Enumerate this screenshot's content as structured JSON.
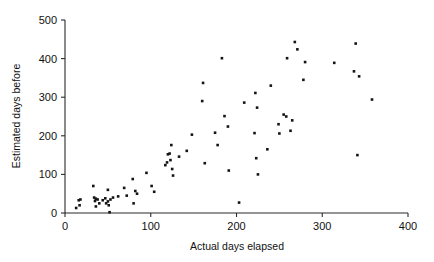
{
  "chart_data": {
    "type": "scatter",
    "title": "",
    "xlabel": "Actual days elapsed",
    "ylabel": "Estimated days before",
    "xlim": [
      0,
      400
    ],
    "ylim": [
      0,
      500
    ],
    "xticks": [
      0,
      100,
      200,
      300,
      400
    ],
    "yticks": [
      0,
      100,
      200,
      300,
      400,
      500
    ],
    "grid": false,
    "legend": null,
    "marker": "filled-square",
    "marker_color": "#141414",
    "series": [
      {
        "name": "observations",
        "points": [
          [
            13,
            13
          ],
          [
            16,
            33
          ],
          [
            17,
            20
          ],
          [
            18,
            35
          ],
          [
            33,
            70
          ],
          [
            34,
            40
          ],
          [
            35,
            31
          ],
          [
            36,
            37
          ],
          [
            36,
            17
          ],
          [
            38,
            35
          ],
          [
            40,
            25
          ],
          [
            44,
            33
          ],
          [
            47,
            38
          ],
          [
            48,
            25
          ],
          [
            50,
            60
          ],
          [
            50,
            30
          ],
          [
            51,
            20
          ],
          [
            52,
            2
          ],
          [
            53,
            35
          ],
          [
            56,
            40
          ],
          [
            62,
            43
          ],
          [
            69,
            65
          ],
          [
            72,
            45
          ],
          [
            79,
            88
          ],
          [
            80,
            25
          ],
          [
            82,
            57
          ],
          [
            84,
            50
          ],
          [
            95,
            104
          ],
          [
            101,
            70
          ],
          [
            104,
            55
          ],
          [
            117,
            124
          ],
          [
            119,
            131
          ],
          [
            120,
            152
          ],
          [
            122,
            154
          ],
          [
            123,
            137
          ],
          [
            124,
            176
          ],
          [
            125,
            114
          ],
          [
            126,
            97
          ],
          [
            133,
            146
          ],
          [
            142,
            161
          ],
          [
            148,
            203
          ],
          [
            160,
            290
          ],
          [
            161,
            337
          ],
          [
            163,
            129
          ],
          [
            175,
            208
          ],
          [
            178,
            176
          ],
          [
            183,
            401
          ],
          [
            186,
            251
          ],
          [
            190,
            224
          ],
          [
            191,
            110
          ],
          [
            203,
            27
          ],
          [
            209,
            286
          ],
          [
            221,
            207
          ],
          [
            222,
            311
          ],
          [
            223,
            142
          ],
          [
            224,
            273
          ],
          [
            225,
            100
          ],
          [
            236,
            165
          ],
          [
            240,
            330
          ],
          [
            249,
            230
          ],
          [
            250,
            206
          ],
          [
            255,
            255
          ],
          [
            258,
            250
          ],
          [
            259,
            401
          ],
          [
            263,
            213
          ],
          [
            265,
            240
          ],
          [
            268,
            443
          ],
          [
            271,
            424
          ],
          [
            278,
            345
          ],
          [
            280,
            391
          ],
          [
            314,
            389
          ],
          [
            337,
            367
          ],
          [
            339,
            439
          ],
          [
            341,
            150
          ],
          [
            343,
            354
          ],
          [
            358,
            294
          ]
        ]
      }
    ]
  },
  "axes": {
    "y_tick_labels": [
      "0",
      "100",
      "200",
      "300",
      "400",
      "500"
    ],
    "x_tick_labels": [
      "0",
      "100",
      "200",
      "300",
      "400"
    ]
  }
}
